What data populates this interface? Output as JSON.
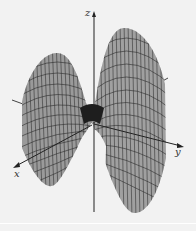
{
  "figure": {
    "surface_fill": "#9a9a9a",
    "mesh_color": "#2a2a2a",
    "background": "#f2f2f2",
    "axes": {
      "x_label": "x",
      "y_label": "y",
      "z_label": "z"
    }
  }
}
